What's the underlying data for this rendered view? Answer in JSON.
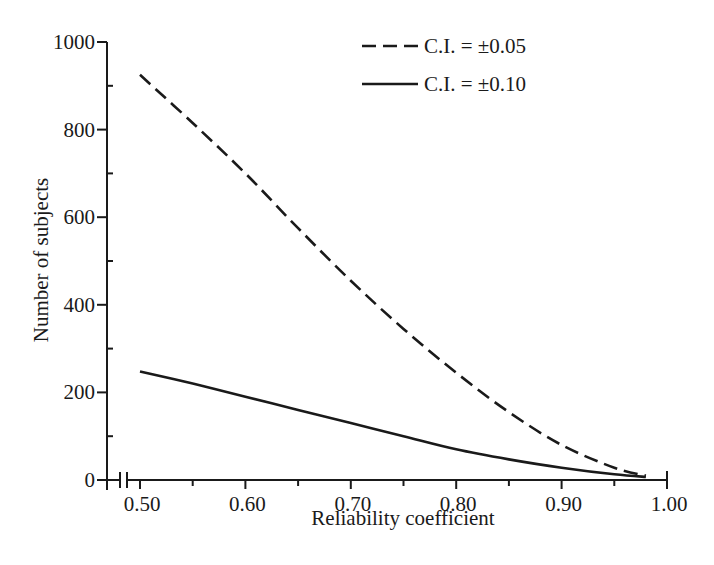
{
  "chart_data": {
    "type": "line",
    "title": "",
    "xlabel": "Reliability coefficient",
    "ylabel": "Number of subjects",
    "xlim": [
      0.5,
      1.0
    ],
    "ylim": [
      0,
      1000
    ],
    "axis_break": "x-axis broken between 0 and 0.50",
    "grid": false,
    "legend_position": "top-right",
    "x_ticks": [
      {
        "value": 0.5,
        "label": "0.50"
      },
      {
        "value": 0.6,
        "label": "0.60"
      },
      {
        "value": 0.7,
        "label": "0.70"
      },
      {
        "value": 0.8,
        "label": "0.80"
      },
      {
        "value": 0.9,
        "label": "0.90"
      },
      {
        "value": 1.0,
        "label": "1.00"
      }
    ],
    "x_minor_ticks": [
      0.55,
      0.65,
      0.75,
      0.85,
      0.95
    ],
    "y_ticks": [
      {
        "value": 0,
        "label": "0"
      },
      {
        "value": 200,
        "label": "200"
      },
      {
        "value": 400,
        "label": "400"
      },
      {
        "value": 600,
        "label": "600"
      },
      {
        "value": 800,
        "label": "800"
      },
      {
        "value": 1000,
        "label": "1000"
      }
    ],
    "y_minor_ticks": [
      100,
      300,
      500,
      700,
      900
    ],
    "series": [
      {
        "name": "C.I. = ±0.05",
        "style": "dashed",
        "x": [
          0.5,
          0.55,
          0.6,
          0.65,
          0.7,
          0.75,
          0.8,
          0.85,
          0.9,
          0.95,
          0.98
        ],
        "values": [
          925,
          815,
          700,
          575,
          455,
          345,
          245,
          155,
          80,
          28,
          10
        ]
      },
      {
        "name": "C.I. = ±0.10",
        "style": "solid",
        "x": [
          0.5,
          0.55,
          0.6,
          0.65,
          0.7,
          0.75,
          0.8,
          0.85,
          0.9,
          0.95,
          0.98
        ],
        "values": [
          248,
          220,
          190,
          160,
          130,
          100,
          70,
          47,
          28,
          13,
          7
        ]
      }
    ]
  },
  "legend": {
    "items": [
      {
        "label": "C.I. = ±0.05",
        "style": "dashed"
      },
      {
        "label": "C.I. = ±0.10",
        "style": "solid"
      }
    ]
  }
}
